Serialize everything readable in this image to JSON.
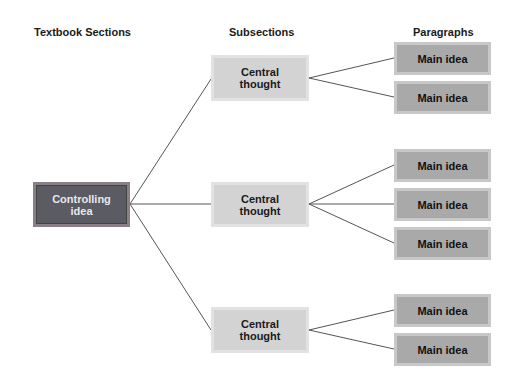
{
  "headers": {
    "col1": "Textbook Sections",
    "col2": "Subsections",
    "col3": "Paragraphs"
  },
  "root": {
    "label": "Controlling idea"
  },
  "subsections": [
    {
      "label": "Central thought",
      "paragraphs": [
        "Main idea",
        "Main idea"
      ]
    },
    {
      "label": "Central thought",
      "paragraphs": [
        "Main idea",
        "Main idea",
        "Main idea"
      ]
    },
    {
      "label": "Central thought",
      "paragraphs": [
        "Main idea",
        "Main idea"
      ]
    }
  ],
  "colors": {
    "root_fill": "#5b5b63",
    "central_fill": "#d3d3d3",
    "main_fill": "#a9a9a9",
    "connector": "#555555"
  }
}
